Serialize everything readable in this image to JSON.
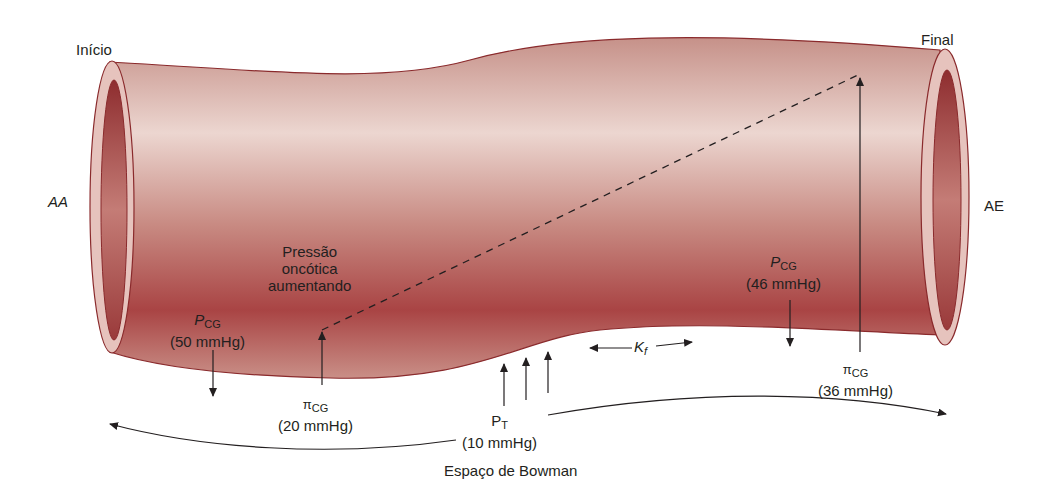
{
  "labels": {
    "start": "Início",
    "end": "Final",
    "afferent": "AA",
    "efferent": "AE",
    "oncotic_note": [
      "Pressão",
      "oncótica",
      "aumentando"
    ],
    "bowman_space": "Espaço de Bowman",
    "kf": "K",
    "kf_sub": "f"
  },
  "pressures": {
    "pcg_start": {
      "symbol": "P",
      "sub": "CG",
      "value": "(50 mmHg)"
    },
    "pcg_end": {
      "symbol": "P",
      "sub": "CG",
      "value": "(46 mmHg)"
    },
    "picg_start": {
      "symbol": "π",
      "sub": "CG",
      "value": "(20 mmHg)"
    },
    "picg_end": {
      "symbol": "π",
      "sub": "CG",
      "value": "(36 mmHg)"
    },
    "pt": {
      "symbol": "P",
      "sub": "T",
      "value": "(10 mmHg)"
    }
  },
  "colors": {
    "tube_dark": "#a8403f",
    "tube_mid": "#c98a84",
    "tube_light": "#ead2cc",
    "rim": "#8a2a2c",
    "arrow": "#231f20"
  }
}
